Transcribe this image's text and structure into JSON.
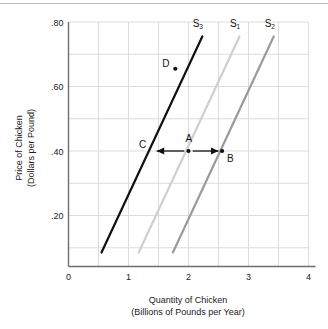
{
  "chart_data": {
    "type": "line",
    "title": "",
    "xlabel": "Quantity of Chicken",
    "xlabel2": "(Billions of Pounds per Year)",
    "ylabel": "Price of Chicken",
    "ylabel2": "(Dollars per Pound)",
    "xlim": [
      0,
      4
    ],
    "ylim": [
      0.0,
      0.8
    ],
    "grid": true,
    "x_major_ticks": [
      "0",
      "1",
      "2",
      "3",
      "4"
    ],
    "x_major_values": [
      0,
      1,
      2,
      3,
      4
    ],
    "x_minor_step": 0.5,
    "y_major_ticks": [
      ".20",
      ".40",
      ".60",
      ".80"
    ],
    "y_major_values": [
      0.2,
      0.4,
      0.6,
      0.8
    ],
    "y_minor_step": 0.1,
    "legend_position": "inline-at-curve-tops",
    "series": [
      {
        "name": "S3",
        "label": "S",
        "subscript": "3",
        "color": "#111111",
        "width": 2.2,
        "points": [
          [
            0.55,
            0.085
          ],
          [
            2.23,
            0.755
          ]
        ],
        "label_x": 2.07,
        "label_y": 0.785
      },
      {
        "name": "S1",
        "label": "S",
        "subscript": "1",
        "color": "#cfcfcf",
        "width": 2.2,
        "points": [
          [
            1.17,
            0.085
          ],
          [
            2.85,
            0.755
          ]
        ],
        "label_x": 2.69,
        "label_y": 0.785
      },
      {
        "name": "S2",
        "label": "S",
        "subscript": "2",
        "color": "#9a9a9a",
        "width": 2.2,
        "points": [
          [
            1.74,
            0.085
          ],
          [
            3.42,
            0.755
          ]
        ],
        "label_x": 3.27,
        "label_y": 0.785
      }
    ],
    "points": [
      {
        "name": "A",
        "x": 2.0,
        "y": 0.4,
        "label": "A",
        "label_dx": -3,
        "label_dy": -9,
        "dot": true
      },
      {
        "name": "B",
        "x": 2.56,
        "y": 0.4,
        "label": "B",
        "label_dx": 5,
        "label_dy": 11,
        "dot": true
      },
      {
        "name": "C",
        "x": 1.39,
        "y": 0.4,
        "label": "C",
        "label_dx": -13,
        "label_dy": -3,
        "dot": false
      },
      {
        "name": "D",
        "x": 1.78,
        "y": 0.655,
        "label": "D",
        "label_dx": -13,
        "label_dy": -2,
        "dot": true
      }
    ],
    "arrows": [
      {
        "name": "leftward-shift-arrow",
        "from_x": 1.93,
        "from_y": 0.4,
        "to_x": 1.47,
        "to_y": 0.4,
        "color": "#111111"
      },
      {
        "name": "rightward-shift-arrow",
        "from_x": 2.07,
        "from_y": 0.4,
        "to_x": 2.5,
        "to_y": 0.4,
        "color": "#111111"
      }
    ],
    "colors": {
      "axis": "#6e6e6e",
      "grid": "#dcdcdc",
      "text": "#1a1a1a",
      "rule": "#b8b8b8"
    }
  }
}
